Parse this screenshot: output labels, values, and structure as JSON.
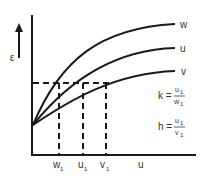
{
  "diagram": {
    "y_axis_label": "ε",
    "x_axis_label": "u",
    "curves": [
      {
        "name": "W",
        "label": "w"
      },
      {
        "name": "U",
        "label": "u"
      },
      {
        "name": "V",
        "label": "v"
      }
    ],
    "x_markers": [
      {
        "base": "w",
        "sub": "1"
      },
      {
        "base": "u",
        "sub": "1"
      },
      {
        "base": "v",
        "sub": "1"
      }
    ],
    "formulas": {
      "k": {
        "lhs": "k =",
        "num_base": "u",
        "num_sub": "1",
        "den_base": "w",
        "den_sub": "1"
      },
      "h": {
        "lhs": "h =",
        "num_base": "u",
        "num_sub": "1",
        "den_base": "v",
        "den_sub": "1"
      }
    },
    "colors": {
      "line": "#1a1a1a",
      "text": "#333333"
    }
  }
}
